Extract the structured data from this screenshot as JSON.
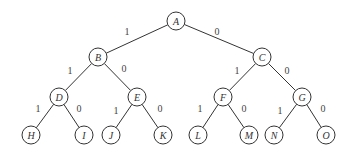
{
  "diagram": {
    "type": "binary-tree",
    "style": {
      "stroke": "#333333",
      "background": "#ffffff",
      "radius": 9
    },
    "nodes": [
      {
        "id": "A",
        "label": "A",
        "x": 176,
        "y": 21
      },
      {
        "id": "B",
        "label": "B",
        "x": 98,
        "y": 57
      },
      {
        "id": "C",
        "label": "C",
        "x": 262,
        "y": 57
      },
      {
        "id": "D",
        "label": "D",
        "x": 59,
        "y": 97
      },
      {
        "id": "E",
        "label": "E",
        "x": 137,
        "y": 97
      },
      {
        "id": "F",
        "label": "F",
        "x": 223,
        "y": 97
      },
      {
        "id": "G",
        "label": "G",
        "x": 302,
        "y": 97
      },
      {
        "id": "H",
        "label": "H",
        "x": 31,
        "y": 135
      },
      {
        "id": "I",
        "label": "I",
        "x": 84,
        "y": 135
      },
      {
        "id": "J",
        "label": "J",
        "x": 111,
        "y": 135
      },
      {
        "id": "K",
        "label": "K",
        "x": 163,
        "y": 135
      },
      {
        "id": "L",
        "label": "L",
        "x": 198,
        "y": 135
      },
      {
        "id": "M",
        "label": "M",
        "x": 249,
        "y": 135
      },
      {
        "id": "N",
        "label": "N",
        "x": 274,
        "y": 135
      },
      {
        "id": "O",
        "label": "O",
        "x": 326,
        "y": 135
      }
    ],
    "edges": [
      {
        "from": "A",
        "to": "B",
        "label": "1",
        "lx": 127,
        "ly": 35
      },
      {
        "from": "A",
        "to": "C",
        "label": "0",
        "lx": 217,
        "ly": 35
      },
      {
        "from": "B",
        "to": "D",
        "label": "1",
        "lx": 70,
        "ly": 74
      },
      {
        "from": "B",
        "to": "E",
        "label": "0",
        "lx": 124,
        "ly": 72
      },
      {
        "from": "C",
        "to": "F",
        "label": "1",
        "lx": 237,
        "ly": 74
      },
      {
        "from": "C",
        "to": "G",
        "label": "0",
        "lx": 287,
        "ly": 74
      },
      {
        "from": "D",
        "to": "H",
        "label": "1",
        "lx": 38,
        "ly": 112
      },
      {
        "from": "D",
        "to": "I",
        "label": "0",
        "lx": 79,
        "ly": 112
      },
      {
        "from": "E",
        "to": "J",
        "label": "1",
        "lx": 116,
        "ly": 114
      },
      {
        "from": "E",
        "to": "K",
        "label": "0",
        "lx": 160,
        "ly": 112
      },
      {
        "from": "F",
        "to": "L",
        "label": "1",
        "lx": 200,
        "ly": 112
      },
      {
        "from": "F",
        "to": "M",
        "label": "0",
        "lx": 244,
        "ly": 112
      },
      {
        "from": "G",
        "to": "N",
        "label": "1",
        "lx": 280,
        "ly": 114
      },
      {
        "from": "G",
        "to": "O",
        "label": "0",
        "lx": 323,
        "ly": 112
      }
    ]
  }
}
